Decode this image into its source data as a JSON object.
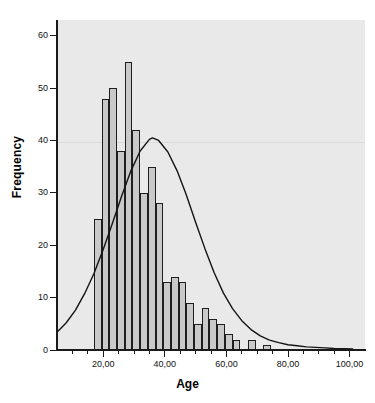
{
  "chart_data": {
    "type": "bar",
    "title": "",
    "xlabel": "Age",
    "ylabel": "Frequency",
    "xlim": [
      5,
      105
    ],
    "ylim": [
      0,
      63
    ],
    "grid": false,
    "legend": null,
    "bin_width": 2.5,
    "x_tick_labels": [
      "20,00",
      "40,00",
      "60,00",
      "80,00",
      "100,00"
    ],
    "x_tick_values": [
      20,
      40,
      60,
      80,
      100
    ],
    "y_tick_labels": [
      "0",
      "10",
      "20",
      "30",
      "40",
      "50",
      "60"
    ],
    "y_tick_values": [
      0,
      10,
      20,
      30,
      40,
      50,
      60
    ],
    "x_minor_tick_values": [
      10,
      15,
      25,
      30,
      35,
      45,
      50,
      55,
      65,
      70,
      75,
      85,
      90,
      95
    ],
    "categories": [
      "17,5",
      "20,0",
      "22,5",
      "25,0",
      "27,5",
      "30,0",
      "32,5",
      "35,0",
      "37,5",
      "40,0",
      "42,5",
      "45,0",
      "47,5",
      "50,0",
      "52,5",
      "55,0",
      "57,5",
      "60,0",
      "62,5",
      "65,0",
      "67,5",
      "70,0",
      "72,5",
      "75,0",
      "77,5",
      "80,0",
      "82,5",
      "85,0",
      "87,5",
      "90,0"
    ],
    "values": [
      25,
      48,
      50,
      38,
      55,
      42,
      30,
      35,
      28,
      13,
      14,
      13,
      9,
      5,
      8,
      6,
      5,
      3,
      2,
      0,
      2,
      0,
      1,
      0,
      0,
      0,
      0,
      0,
      0,
      0
    ],
    "bin_left_edges": [
      17.0,
      19.5,
      22.0,
      24.5,
      27.0,
      29.5,
      32.0,
      34.5,
      37.0,
      39.5,
      42.0,
      44.5,
      47.0,
      49.5,
      52.0,
      54.5,
      57.0,
      59.5,
      62.0,
      64.5,
      67.0,
      69.5,
      72.0,
      74.5,
      77.0,
      79.5,
      82.0,
      84.5,
      87.0,
      89.5
    ],
    "normal_curve": {
      "label": "Normal curve",
      "peak_x": 36,
      "peak_y": 40.5,
      "x": [
        5,
        8,
        11,
        14,
        17,
        20,
        23,
        26,
        29,
        32,
        35,
        36,
        38,
        41,
        44,
        47,
        50,
        53,
        56,
        59,
        62,
        65,
        68,
        71,
        74,
        77,
        80,
        83,
        86,
        89,
        92,
        95,
        98,
        101
      ],
      "y": [
        3.4,
        5.2,
        7.6,
        10.8,
        14.6,
        19.2,
        24.2,
        29.4,
        34.2,
        38.0,
        40.2,
        40.5,
        40.0,
        37.8,
        34.2,
        29.6,
        24.4,
        19.4,
        14.8,
        10.9,
        7.9,
        5.6,
        3.9,
        2.7,
        1.9,
        1.4,
        1.0,
        0.8,
        0.6,
        0.5,
        0.4,
        0.3,
        0.25,
        0.2
      ]
    }
  },
  "style": {
    "plot_background": "#e9e9e9",
    "bar_fill": "#c9c9c9",
    "bar_stroke": "#1e1e1e",
    "curve_color": "#141414",
    "axis_color": "#1a1a1a",
    "text_color": "#111111"
  }
}
